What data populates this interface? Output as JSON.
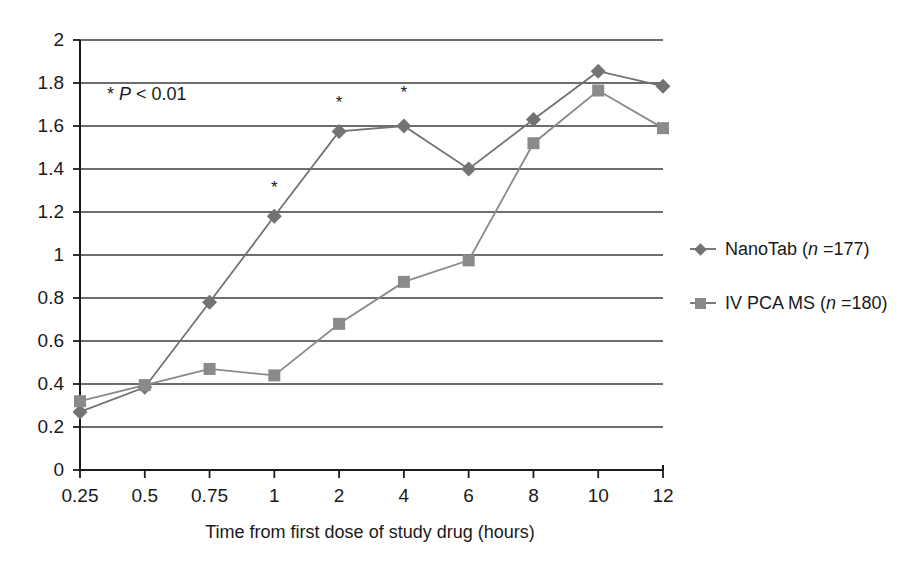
{
  "chart_data": {
    "type": "line",
    "title": "",
    "xlabel": "Time from first dose of study drug (hours)",
    "ylabel": "",
    "categories": [
      "0.25",
      "0.5",
      "0.75",
      "1",
      "2",
      "4",
      "6",
      "8",
      "10",
      "12"
    ],
    "ylim": [
      0,
      2
    ],
    "ytick_labels": [
      "0",
      "0.2",
      "0.4",
      "0.6",
      "0.8",
      "1",
      "1.2",
      "1.4",
      "1.6",
      "1.8",
      "2"
    ],
    "ytick_values": [
      0,
      0.2,
      0.4,
      0.6,
      0.8,
      1,
      1.2,
      1.4,
      1.6,
      1.8,
      2
    ],
    "grid": "horizontal",
    "legend_position": "right",
    "series": [
      {
        "name": "NanoTab (n =177)",
        "label_main": "NanoTab (",
        "label_italic": "n",
        "label_tail": " =177)",
        "marker": "diamond",
        "color": "#737373",
        "values": [
          0.27,
          0.385,
          0.78,
          1.18,
          1.575,
          1.6,
          1.4,
          1.63,
          1.855,
          1.785
        ]
      },
      {
        "name": "IV PCA MS (n =180)",
        "label_main": "IV PCA MS (",
        "label_italic": "n",
        "label_tail": " =180)",
        "marker": "square",
        "color": "#8a8a8a",
        "values": [
          0.32,
          0.395,
          0.47,
          0.44,
          0.68,
          0.875,
          0.975,
          1.52,
          1.765,
          1.59
        ]
      }
    ],
    "annotations": [
      {
        "name": "p-value-note",
        "text_star": "*",
        "text_italic": "P",
        "text_tail": " < 0.01",
        "x_category": null,
        "y": 1.705
      }
    ],
    "significance_markers": [
      {
        "symbol": "*",
        "x_category": "1",
        "y": 1.31
      },
      {
        "symbol": "*",
        "x_category": "2",
        "y": 1.705
      },
      {
        "symbol": "*",
        "x_category": "4",
        "y": 1.755
      }
    ]
  },
  "colors": {
    "axis": "#1a1a1a",
    "grid": "#3c3c3c",
    "series1": "#737373",
    "series2": "#8a8a8a",
    "background": "#ffffff"
  }
}
